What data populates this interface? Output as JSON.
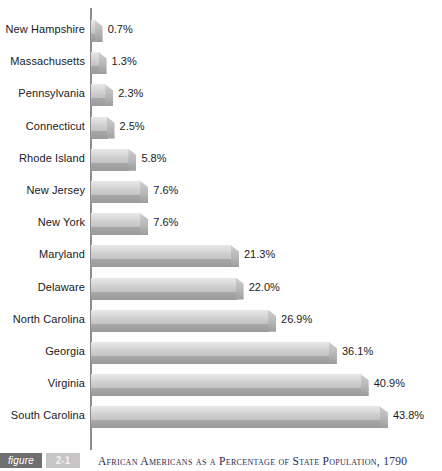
{
  "chart_data": {
    "type": "bar",
    "orientation": "horizontal",
    "title": "African Americans as a Percentage of State Population, 1790",
    "xlabel": "",
    "ylabel": "",
    "xlim": [
      0,
      45
    ],
    "grid": false,
    "legend": null,
    "value_suffix": "%",
    "categories": [
      "New Hampshire",
      "Massachusetts",
      "Pennsylvania",
      "Connecticut",
      "Rhode Island",
      "New Jersey",
      "New York",
      "Maryland",
      "Delaware",
      "North Carolina",
      "Georgia",
      "Virginia",
      "South Carolina"
    ],
    "values": [
      0.7,
      1.3,
      2.3,
      2.5,
      5.8,
      7.6,
      7.6,
      21.3,
      22.0,
      26.9,
      36.1,
      40.9,
      43.8
    ],
    "value_labels": [
      "0.7%",
      "1.3%",
      "2.3%",
      "2.5%",
      "5.8%",
      "7.6%",
      "7.6%",
      "21.3%",
      "22.0%",
      "26.9%",
      "36.1%",
      "40.9%",
      "43.8%"
    ],
    "bar_color": "#d2d2d2",
    "bar_shadow_color": "#9a9a9a",
    "axis_color": "#8d8d8d"
  },
  "caption": {
    "figure_label": "figure",
    "figure_number": "2-1",
    "title": "African Americans as a Percentage of State Population, 1790"
  }
}
